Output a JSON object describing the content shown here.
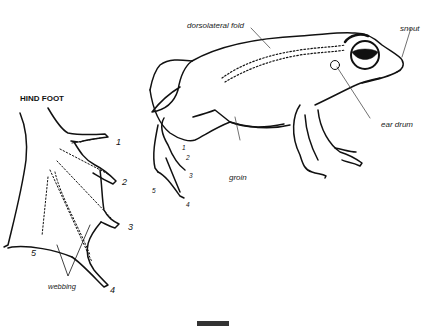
{
  "diagram": {
    "hind_foot_title": "HIND FOOT",
    "foot_labels": {
      "toe_numbers": [
        "1",
        "2",
        "3",
        "4",
        "5"
      ],
      "webbing": "webbing"
    },
    "frog_labels": {
      "dorsolateral_fold": "dorsolateral fold",
      "snout": "snout",
      "ear_drum": "ear drum",
      "groin": "groin",
      "toe_numbers": [
        "1",
        "2",
        "3",
        "4",
        "5"
      ]
    }
  }
}
